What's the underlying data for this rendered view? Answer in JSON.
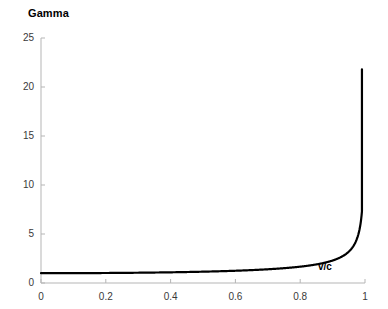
{
  "chart_data": {
    "type": "line",
    "title": "Gamma",
    "xlabel": "v/c",
    "ylabel": "",
    "xlim": [
      0,
      1
    ],
    "ylim": [
      0,
      25
    ],
    "xticks": [
      "0",
      "0.2",
      "0.4",
      "0.6",
      "0.8",
      "1"
    ],
    "xtick_values": [
      0,
      0.2,
      0.4,
      0.6,
      0.8,
      1
    ],
    "yticks": [
      "0",
      "5",
      "10",
      "15",
      "20",
      "25"
    ],
    "ytick_values": [
      0,
      5,
      10,
      15,
      20,
      25
    ],
    "grid": false,
    "legend": "none",
    "series": [
      {
        "name": "Gamma",
        "color": "#000000",
        "x": [
          0,
          0.05,
          0.1,
          0.15,
          0.2,
          0.25,
          0.3,
          0.35,
          0.4,
          0.45,
          0.5,
          0.55,
          0.6,
          0.65,
          0.7,
          0.75,
          0.8,
          0.84,
          0.88,
          0.9,
          0.92,
          0.94,
          0.95,
          0.96,
          0.97,
          0.975,
          0.98,
          0.985,
          0.99,
          0.9905,
          0.991,
          0.9915
        ],
        "values": [
          1,
          1.001,
          1.005,
          1.011,
          1.021,
          1.033,
          1.048,
          1.068,
          1.091,
          1.12,
          1.155,
          1.198,
          1.25,
          1.316,
          1.4,
          1.512,
          1.667,
          1.843,
          2.105,
          2.294,
          2.552,
          2.931,
          3.203,
          3.571,
          4.113,
          4.501,
          5.025,
          5.799,
          7.089,
          7.27,
          7.5,
          7.7
        ]
      }
    ],
    "curve_note": "gamma = 1/sqrt(1-(v/c)^2), asymptotic near v/c=1, peak drawn at approximately 21.8",
    "peak_value": 21.8,
    "peak_x": 0.9906
  },
  "axes": {
    "axis_color": "#b5b5b5",
    "tick_color": "#b5b5b5",
    "label_color": "#3a3a3a"
  },
  "style": {
    "background": "#ffffff",
    "curve_color": "#000000"
  }
}
